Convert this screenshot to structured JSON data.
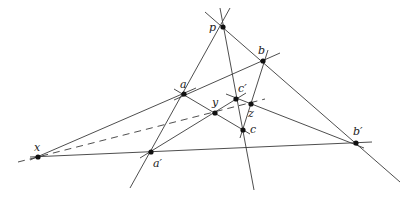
{
  "diagram": {
    "points": [
      {
        "id": "p",
        "label": "p",
        "x": 223,
        "y": 27,
        "lx": 209,
        "ly": 22
      },
      {
        "id": "b",
        "label": "b",
        "x": 263,
        "y": 61,
        "lx": 258,
        "ly": 45
      },
      {
        "id": "a",
        "label": "a",
        "x": 184,
        "y": 94,
        "lx": 180,
        "ly": 79
      },
      {
        "id": "c_prime",
        "label": "c′",
        "x": 236,
        "y": 99,
        "lx": 238,
        "ly": 83
      },
      {
        "id": "z",
        "label": "z",
        "x": 251,
        "y": 104,
        "lx": 248,
        "ly": 108
      },
      {
        "id": "y",
        "label": "y",
        "x": 215,
        "y": 113,
        "lx": 212,
        "ly": 97
      },
      {
        "id": "c",
        "label": "c",
        "x": 243,
        "y": 130,
        "lx": 250,
        "ly": 124
      },
      {
        "id": "x",
        "label": "x",
        "x": 38,
        "y": 157,
        "lx": 34,
        "ly": 142
      },
      {
        "id": "a_prime",
        "label": "a′",
        "x": 151,
        "y": 152,
        "lx": 153,
        "ly": 158
      },
      {
        "id": "b_prime",
        "label": "b′",
        "x": 356,
        "y": 143,
        "lx": 353,
        "ly": 126
      }
    ],
    "lines": [
      {
        "name": "line-p-a-aprime",
        "x1": 230,
        "y1": 8,
        "x2": 130,
        "y2": 188,
        "dashed": false
      },
      {
        "name": "line-p-cprime-c",
        "x1": 220,
        "y1": 8,
        "x2": 254,
        "y2": 190,
        "dashed": false
      },
      {
        "name": "line-p-b-bprime",
        "x1": 205,
        "y1": 12,
        "x2": 400,
        "y2": 182,
        "dashed": false
      },
      {
        "name": "line-a-b",
        "x1": 174,
        "y1": 100,
        "x2": 280,
        "y2": 53,
        "dashed": false
      },
      {
        "name": "line-b-z-c",
        "x1": 268,
        "y1": 50,
        "x2": 240,
        "y2": 138,
        "dashed": false
      },
      {
        "name": "line-x-a",
        "x1": 30,
        "y1": 160,
        "x2": 196,
        "y2": 88,
        "dashed": false
      },
      {
        "name": "line-a-y-c",
        "x1": 174,
        "y1": 89,
        "x2": 250,
        "y2": 134,
        "dashed": false
      },
      {
        "name": "line-x-aprime-bprime",
        "x1": 30,
        "y1": 157,
        "x2": 372,
        "y2": 142,
        "dashed": false
      },
      {
        "name": "line-aprime-y-cprime",
        "x1": 140,
        "y1": 158,
        "x2": 246,
        "y2": 93,
        "dashed": false
      },
      {
        "name": "line-cprime-z-bprime",
        "x1": 226,
        "y1": 94,
        "x2": 364,
        "y2": 148,
        "dashed": false
      },
      {
        "name": "line-x-y-z-dashed",
        "x1": 18,
        "y1": 162,
        "x2": 265,
        "y2": 99,
        "dashed": true
      }
    ]
  }
}
